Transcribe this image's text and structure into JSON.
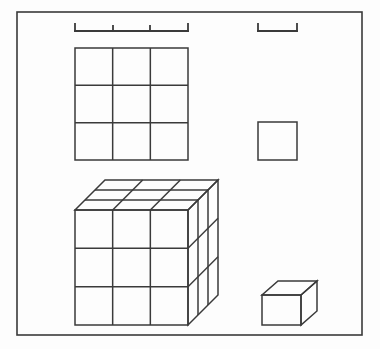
{
  "figure": {
    "background_color": "#fdfdfd",
    "line_color": "#3a3a3a",
    "frame": {
      "name": "outer-border-frame",
      "x": 17,
      "y": 12,
      "width": 345,
      "height": 323,
      "stroke_width": 1.6
    },
    "brackets": [
      {
        "id": "bracket-three-units",
        "label": "3-unit measurement bracket",
        "x_start": 75,
        "x_end": 188,
        "y": 31,
        "tick_height": 7,
        "divisions": 3,
        "tick_positions": [
          75,
          113,
          150,
          188
        ],
        "stroke_width": 1.8
      },
      {
        "id": "bracket-one-unit",
        "label": "1-unit measurement bracket",
        "x_start": 258,
        "x_end": 297,
        "y": 31,
        "tick_height": 7,
        "divisions": 1,
        "tick_positions": [
          258,
          297
        ],
        "stroke_width": 1.8
      }
    ],
    "shapes": {
      "square_grid": {
        "name": "square-grid-3x3",
        "x": 75,
        "y": 48,
        "width": 113,
        "height": 112,
        "rows": 3,
        "cols": 3,
        "cell_count": 9,
        "stroke_width": 1.5
      },
      "unit_square": {
        "name": "unit-square",
        "x": 258,
        "y": 122,
        "width": 39,
        "height": 38,
        "stroke_width": 1.5
      },
      "big_cube": {
        "name": "cube-3x3x3",
        "front_x": 75,
        "front_y": 210,
        "front_width": 113,
        "front_height": 115,
        "depth_dx": 30,
        "depth_dy": -30,
        "divisions": 3,
        "unit_count": 27,
        "stroke_width": 1.5
      },
      "unit_cube": {
        "name": "unit-cube",
        "front_x": 262,
        "front_y": 295,
        "front_width": 39,
        "front_height": 30,
        "depth_dx": 16,
        "depth_dy": -14,
        "unit_count": 1,
        "stroke_width": 1.5
      }
    }
  }
}
